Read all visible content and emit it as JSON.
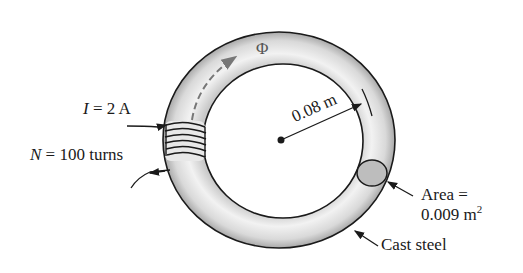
{
  "figure": {
    "labels": {
      "current_symbol": "I",
      "current_eq": "= 2 A",
      "turns_symbol": "N",
      "turns_eq": "= 100 turns",
      "flux": "Φ",
      "radius": "0.08 m",
      "area_line1": "Area =",
      "area_line2": "0.009 m",
      "area_exp": "2",
      "material": "Cast steel"
    },
    "colors": {
      "ring_fill": "#e4e4e4",
      "ring_shade": "#b8b8b8",
      "outline": "#1a1a1a",
      "cross_section": "#bdbdbd",
      "flux_arrow": "#777777"
    }
  }
}
